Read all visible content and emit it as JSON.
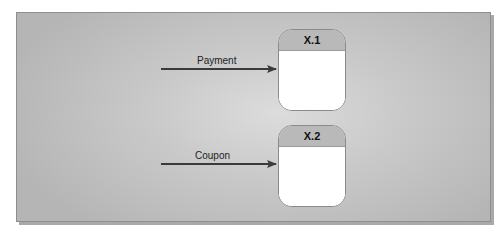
{
  "diagram": {
    "type": "data-flow-diagram",
    "processes": [
      {
        "id": "X.1",
        "label": "X.1"
      },
      {
        "id": "X.2",
        "label": "X.2"
      }
    ],
    "flows": [
      {
        "label": "Payment",
        "to": "X.1"
      },
      {
        "label": "Coupon",
        "to": "X.2"
      }
    ],
    "colors": {
      "panel": "#c6c6c6",
      "process_header": "#b9b9b9",
      "process_body": "#ffffff",
      "arrow": "#3a3a3a"
    }
  }
}
